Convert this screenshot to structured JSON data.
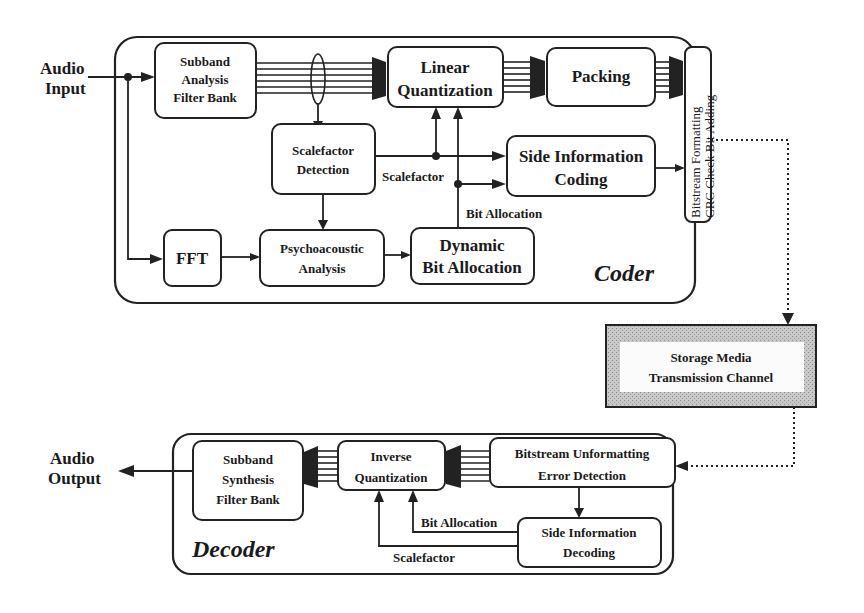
{
  "diagram": {
    "coder": {
      "title": "Coder",
      "input_label": [
        "Audio",
        "Input"
      ],
      "blocks": {
        "subband_analysis": [
          "Subband",
          "Analysis",
          "Filter Bank"
        ],
        "linear_quantization": [
          "Linear",
          "Quantization"
        ],
        "packing": [
          "Packing"
        ],
        "bitstream_formatting": [
          "Bitstream Formatting",
          "CRC Check Bit Adding"
        ],
        "scalefactor_detection": [
          "Scalefactor",
          "Detection"
        ],
        "side_information_coding": [
          "Side Information",
          "Coding"
        ],
        "fft": [
          "FFT"
        ],
        "psychoacoustic_analysis": [
          "Psychoacoustic",
          "Analysis"
        ],
        "dynamic_bit_allocation": [
          "Dynamic",
          "Bit Allocation"
        ]
      },
      "edge_labels": {
        "scalefactor": "Scalefactor",
        "bit_allocation": "Bit Allocation"
      }
    },
    "channel": {
      "label": [
        "Storage Media",
        "Transmission Channel"
      ],
      "fill_color": "#bdbdbd"
    },
    "decoder": {
      "title": "Decoder",
      "output_label": [
        "Audio",
        "Output"
      ],
      "blocks": {
        "subband_synthesis": [
          "Subband",
          "Synthesis",
          "Filter Bank"
        ],
        "inverse_quantization": [
          "Inverse",
          "Quantization"
        ],
        "bitstream_unformatting": [
          "Bitstream Unformatting",
          "Error Detection"
        ],
        "side_information_decoding": [
          "Side Information",
          "Decoding"
        ]
      },
      "edge_labels": {
        "bit_allocation": "Bit Allocation",
        "scalefactor": "Scalefactor"
      }
    }
  }
}
